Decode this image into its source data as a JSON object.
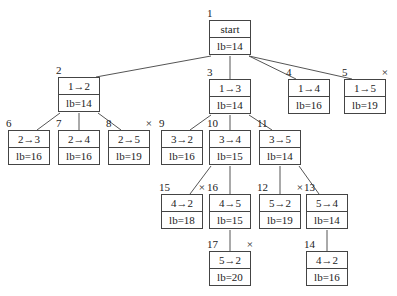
{
  "tree": {
    "nodes": [
      {
        "id": "1",
        "step": "start",
        "lb": "lb=14",
        "pruned": false,
        "x": 209,
        "y": 20
      },
      {
        "id": "2",
        "step": "1→2",
        "lb": "lb=14",
        "pruned": false,
        "x": 58,
        "y": 77
      },
      {
        "id": "3",
        "step": "1→3",
        "lb": "lb=14",
        "pruned": false,
        "x": 209,
        "y": 79
      },
      {
        "id": "4",
        "step": "1→4",
        "lb": "lb=16",
        "pruned": false,
        "x": 288,
        "y": 79
      },
      {
        "id": "5",
        "step": "1→5",
        "lb": "lb=19",
        "pruned": true,
        "x": 344,
        "y": 79
      },
      {
        "id": "6",
        "step": "2→3",
        "lb": "lb=16",
        "pruned": false,
        "x": 8,
        "y": 130
      },
      {
        "id": "7",
        "step": "2→4",
        "lb": "lb=16",
        "pruned": false,
        "x": 58,
        "y": 130
      },
      {
        "id": "8",
        "step": "2→5",
        "lb": "lb=19",
        "pruned": true,
        "x": 108,
        "y": 130
      },
      {
        "id": "9",
        "step": "3→2",
        "lb": "lb=16",
        "pruned": false,
        "x": 161,
        "y": 130
      },
      {
        "id": "10",
        "step": "3→4",
        "lb": "lb=15",
        "pruned": false,
        "x": 209,
        "y": 130
      },
      {
        "id": "11",
        "step": "3→5",
        "lb": "lb=14",
        "pruned": false,
        "x": 259,
        "y": 130
      },
      {
        "id": "15",
        "step": "4→2",
        "lb": "lb=18",
        "pruned": true,
        "x": 161,
        "y": 194
      },
      {
        "id": "16",
        "step": "4→5",
        "lb": "lb=15",
        "pruned": false,
        "x": 209,
        "y": 194
      },
      {
        "id": "12",
        "step": "5→2",
        "lb": "lb=19",
        "pruned": true,
        "x": 259,
        "y": 194
      },
      {
        "id": "13",
        "step": "5→4",
        "lb": "lb=14",
        "pruned": false,
        "x": 306,
        "y": 194
      },
      {
        "id": "17",
        "step": "5→2",
        "lb": "lb=20",
        "pruned": true,
        "x": 209,
        "y": 251
      },
      {
        "id": "14",
        "step": "4→2",
        "lb": "lb=16",
        "pruned": false,
        "x": 306,
        "y": 251
      }
    ],
    "edges": [
      [
        "1",
        "2"
      ],
      [
        "1",
        "3"
      ],
      [
        "1",
        "4"
      ],
      [
        "1",
        "5"
      ],
      [
        "2",
        "6"
      ],
      [
        "2",
        "7"
      ],
      [
        "2",
        "8"
      ],
      [
        "3",
        "9"
      ],
      [
        "3",
        "10"
      ],
      [
        "3",
        "11"
      ],
      [
        "10",
        "15"
      ],
      [
        "10",
        "16"
      ],
      [
        "11",
        "12"
      ],
      [
        "11",
        "13"
      ],
      [
        "16",
        "17"
      ],
      [
        "13",
        "14"
      ]
    ],
    "pruned_mark": "×"
  }
}
